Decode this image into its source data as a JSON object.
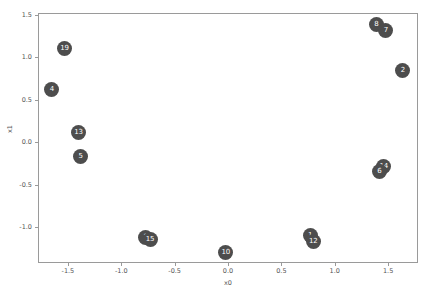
{
  "chart_data": {
    "type": "scatter",
    "title": "",
    "xlabel": "x0",
    "ylabel": "x1",
    "xlim": [
      -1.78,
      1.78
    ],
    "ylim": [
      -1.42,
      1.52
    ],
    "grid": false,
    "legend": "none",
    "marker_color": "#4d4d4d",
    "marker_label_color": "#ffffff",
    "xticks": [
      -1.5,
      -1.0,
      -0.5,
      0.0,
      0.5,
      1.0,
      1.5
    ],
    "xticklabels": [
      "-1.5",
      "-1.0",
      "-0.5",
      "0.0",
      "0.5",
      "1.0",
      "1.5"
    ],
    "yticks": [
      1.5,
      1.0,
      0.5,
      0.0,
      -0.5,
      -1.0
    ],
    "yticklabels": [
      "1.5",
      "1.0",
      "0.5",
      "0.0",
      "-0.5",
      "-1.0"
    ],
    "points": [
      {
        "label": "8",
        "x": 1.38,
        "y": 1.4
      },
      {
        "label": "7",
        "x": 1.47,
        "y": 1.33
      },
      {
        "label": "2",
        "x": 1.63,
        "y": 0.86
      },
      {
        "label": "19",
        "x": -1.54,
        "y": 1.12
      },
      {
        "label": "4",
        "x": -1.66,
        "y": 0.63
      },
      {
        "label": "13",
        "x": -1.41,
        "y": 0.13
      },
      {
        "label": "5",
        "x": -1.39,
        "y": -0.16
      },
      {
        "label": "14",
        "x": 1.45,
        "y": -0.27
      },
      {
        "label": "6",
        "x": 1.41,
        "y": -0.33
      },
      {
        "label": "3",
        "x": -0.78,
        "y": -1.11
      },
      {
        "label": "15",
        "x": -0.74,
        "y": -1.13
      },
      {
        "label": "1",
        "x": 0.76,
        "y": -1.09
      },
      {
        "label": "12",
        "x": 0.79,
        "y": -1.16
      },
      {
        "label": "10",
        "x": -0.03,
        "y": -1.29
      }
    ]
  }
}
